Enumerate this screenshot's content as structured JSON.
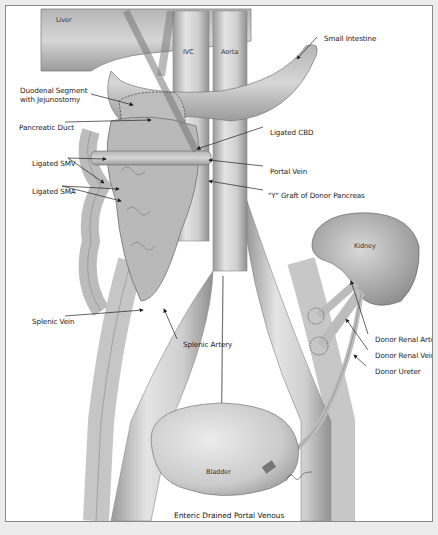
{
  "figure": {
    "caption": "Enteric Drained Portal Venous",
    "colors": {
      "background": "#ffffff",
      "outer": "#ececec",
      "border": "#8a8a8a",
      "tissue": "#c9c9c9",
      "tissue_dark": "#8c8c8c",
      "line": "#222222"
    }
  },
  "structures": {
    "liver": "Liver",
    "ivc": "IVC",
    "aorta": "Aorta",
    "kidney": "Kidney",
    "bladder": "Bladder"
  },
  "labels": {
    "small_intestine": "Small Intestine",
    "duodenal_segment_1": "Duodenal Segment",
    "duodenal_segment_2": "with Jejunostomy",
    "pancreatic_duct": "Pancreatic Duct",
    "ligated_cbd": "Ligated CBD",
    "ligated_smv": "Ligated SMV",
    "portal_vein": "Portal Vein",
    "ligated_sma": "Ligated SMA",
    "y_graft": "\"Y\" Graft of Donor Pancreas",
    "splenic_vein": "Splenic Vein",
    "splenic_artery": "Splenic Artery",
    "donor_renal_artery": "Donor Renal Artery",
    "donor_renal_vein": "Donor Renal Vein",
    "donor_ureter": "Donor Ureter"
  }
}
